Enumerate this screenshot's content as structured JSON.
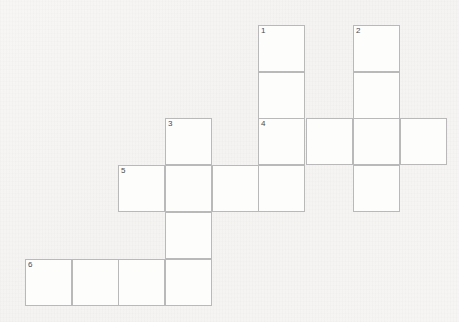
{
  "puzzle": {
    "title": "Crossword Grid",
    "type": "crossword-grid",
    "background_color": "#f5f4f2",
    "cell_fill_color": "#fdfdfc",
    "cell_border_color": "#b9b9b9",
    "number_color": "#4a4a4a",
    "cell_size_px": 47,
    "grid_origin": {
      "x": 25,
      "y": 25
    },
    "columns_x": [
      25,
      72,
      118,
      165,
      212,
      258,
      306,
      353,
      400
    ],
    "rows_y": [
      25,
      72,
      118,
      165,
      212,
      259
    ],
    "grid_columns": 9,
    "grid_rows": 6,
    "cells": [
      {
        "name": "cell-c5-r0",
        "col": 5,
        "row": 0,
        "number": "1",
        "letter": ""
      },
      {
        "name": "cell-c7-r0",
        "col": 7,
        "row": 0,
        "number": "2",
        "letter": ""
      },
      {
        "name": "cell-c5-r1",
        "col": 5,
        "row": 1,
        "number": "",
        "letter": ""
      },
      {
        "name": "cell-c7-r1",
        "col": 7,
        "row": 1,
        "number": "",
        "letter": ""
      },
      {
        "name": "cell-c3-r2",
        "col": 3,
        "row": 2,
        "number": "3",
        "letter": ""
      },
      {
        "name": "cell-c5-r2",
        "col": 5,
        "row": 2,
        "number": "4",
        "letter": ""
      },
      {
        "name": "cell-c6-r2",
        "col": 6,
        "row": 2,
        "number": "",
        "letter": ""
      },
      {
        "name": "cell-c7-r2",
        "col": 7,
        "row": 2,
        "number": "",
        "letter": ""
      },
      {
        "name": "cell-c8-r2",
        "col": 8,
        "row": 2,
        "number": "",
        "letter": ""
      },
      {
        "name": "cell-c2-r3",
        "col": 2,
        "row": 3,
        "number": "5",
        "letter": ""
      },
      {
        "name": "cell-c3-r3",
        "col": 3,
        "row": 3,
        "number": "",
        "letter": ""
      },
      {
        "name": "cell-c4-r3",
        "col": 4,
        "row": 3,
        "number": "",
        "letter": ""
      },
      {
        "name": "cell-c5-r3",
        "col": 5,
        "row": 3,
        "number": "",
        "letter": ""
      },
      {
        "name": "cell-c7-r3",
        "col": 7,
        "row": 3,
        "number": "",
        "letter": ""
      },
      {
        "name": "cell-c3-r4",
        "col": 3,
        "row": 4,
        "number": "",
        "letter": ""
      },
      {
        "name": "cell-c0-r5",
        "col": 0,
        "row": 5,
        "number": "6",
        "letter": ""
      },
      {
        "name": "cell-c1-r5",
        "col": 1,
        "row": 5,
        "number": "",
        "letter": ""
      },
      {
        "name": "cell-c2-r5",
        "col": 2,
        "row": 5,
        "number": "",
        "letter": ""
      },
      {
        "name": "cell-c3-r5",
        "col": 3,
        "row": 5,
        "number": "",
        "letter": ""
      }
    ],
    "entries": {
      "across": [
        {
          "number": "4",
          "start_col": 5,
          "row": 2,
          "length": 4
        },
        {
          "number": "5",
          "start_col": 2,
          "row": 3,
          "length": 4
        },
        {
          "number": "6",
          "start_col": 0,
          "row": 5,
          "length": 4
        }
      ],
      "down": [
        {
          "number": "1",
          "col": 5,
          "start_row": 0,
          "length": 4
        },
        {
          "number": "2",
          "col": 7,
          "start_row": 0,
          "length": 4
        },
        {
          "number": "3",
          "col": 3,
          "start_row": 2,
          "length": 4
        }
      ]
    }
  }
}
